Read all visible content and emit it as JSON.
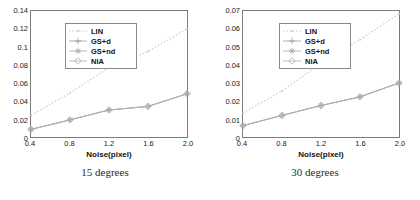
{
  "chart_data": [
    {
      "type": "line",
      "title": "",
      "caption": "15 degrees",
      "xlabel": "Noise(pixel)",
      "ylabel": "",
      "x": [
        0.4,
        0.8,
        1.2,
        1.6,
        2.0
      ],
      "xticks": [
        "0.4",
        "0.8",
        "1.2",
        "1.6",
        "2.0"
      ],
      "yticks": [
        "0",
        "0.02",
        "0.04",
        "0.06",
        "0.08",
        "0.1",
        "0.12",
        "0.14"
      ],
      "ytickvalues": [
        0,
        0.02,
        0.04,
        0.06,
        0.08,
        0.1,
        0.12,
        0.14
      ],
      "xlim": [
        0.4,
        2.0
      ],
      "ylim": [
        0,
        0.14
      ],
      "grid": false,
      "legend_position": "top-left",
      "series": [
        {
          "name": "LIN",
          "values": [
            0.024,
            0.049,
            0.077,
            0.095,
            0.12
          ],
          "color": "#c9c9c9",
          "style": "dotted",
          "marker": "dot"
        },
        {
          "name": "GS+d",
          "values": [
            0.0085,
            0.019,
            0.03,
            0.034,
            0.048
          ],
          "color": "#9a9a9a",
          "style": "solid",
          "marker": "plus"
        },
        {
          "name": "GS+nd",
          "values": [
            0.0085,
            0.019,
            0.03,
            0.034,
            0.048
          ],
          "color": "#a8a8a8",
          "style": "solid",
          "marker": "star"
        },
        {
          "name": "NIA",
          "values": [
            0.0085,
            0.019,
            0.03,
            0.034,
            0.048
          ],
          "color": "#b0b0b0",
          "style": "solid",
          "marker": "diamond"
        }
      ]
    },
    {
      "type": "line",
      "title": "",
      "caption": "30 degrees",
      "xlabel": "Noise(pixel)",
      "ylabel": "",
      "x": [
        0.4,
        0.8,
        1.2,
        1.6,
        2.0
      ],
      "xticks": [
        "0.4",
        "0.8",
        "1.2",
        "1.6",
        "2.0"
      ],
      "yticks": [
        "0",
        "0.01",
        "0.02",
        "0.03",
        "0.04",
        "0.05",
        "0.06",
        "0.07"
      ],
      "ytickvalues": [
        0,
        0.01,
        0.02,
        0.03,
        0.04,
        0.05,
        0.06,
        0.07
      ],
      "xlim": [
        0.4,
        2.0
      ],
      "ylim": [
        0,
        0.07
      ],
      "grid": false,
      "legend_position": "top-left",
      "series": [
        {
          "name": "LIN",
          "values": [
            0.0135,
            0.0255,
            0.041,
            0.054,
            0.0685
          ],
          "color": "#c9c9c9",
          "style": "dotted",
          "marker": "dot"
        },
        {
          "name": "GS+d",
          "values": [
            0.0063,
            0.012,
            0.0175,
            0.0223,
            0.03
          ],
          "color": "#9a9a9a",
          "style": "solid",
          "marker": "plus"
        },
        {
          "name": "GS+nd",
          "values": [
            0.0063,
            0.012,
            0.0175,
            0.0223,
            0.03
          ],
          "color": "#a8a8a8",
          "style": "solid",
          "marker": "star"
        },
        {
          "name": "NIA",
          "values": [
            0.0063,
            0.012,
            0.0175,
            0.0223,
            0.03
          ],
          "color": "#b0b0b0",
          "style": "solid",
          "marker": "diamond"
        }
      ]
    }
  ]
}
